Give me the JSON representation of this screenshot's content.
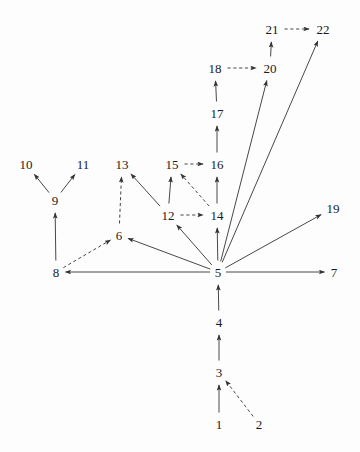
{
  "figure": {
    "type": "directed-graph",
    "background_color": "#fdfdfd",
    "stroke_color": "#333333",
    "label_color": "#1a1a1a",
    "width": 360,
    "height": 452
  },
  "nodes": [
    {
      "id": "1",
      "label": "1",
      "x": 219,
      "y": 424
    },
    {
      "id": "2",
      "label": "2",
      "x": 259,
      "y": 424
    },
    {
      "id": "3",
      "label": "3",
      "x": 219,
      "y": 372
    },
    {
      "id": "4",
      "label": "4",
      "x": 219,
      "y": 322
    },
    {
      "id": "5",
      "label": "5",
      "x": 218,
      "y": 272
    },
    {
      "id": "6",
      "label": "6",
      "x": 119,
      "y": 235
    },
    {
      "id": "7",
      "label": "7",
      "x": 334,
      "y": 272
    },
    {
      "id": "8",
      "label": "8",
      "x": 56,
      "y": 272
    },
    {
      "id": "9",
      "label": "9",
      "x": 55,
      "y": 200
    },
    {
      "id": "10",
      "label": "10",
      "x": 26,
      "y": 164
    },
    {
      "id": "11",
      "label": "11",
      "x": 83,
      "y": 164
    },
    {
      "id": "12",
      "label": "12",
      "x": 168,
      "y": 215
    },
    {
      "id": "13",
      "label": "13",
      "x": 122,
      "y": 164
    },
    {
      "id": "14",
      "label": "14",
      "x": 217,
      "y": 215
    },
    {
      "id": "15",
      "label": "15",
      "x": 172,
      "y": 164
    },
    {
      "id": "16",
      "label": "16",
      "x": 217,
      "y": 164
    },
    {
      "id": "17",
      "label": "17",
      "x": 217,
      "y": 113
    },
    {
      "id": "18",
      "label": "18",
      "x": 215,
      "y": 68
    },
    {
      "id": "19",
      "label": "19",
      "x": 333,
      "y": 208
    },
    {
      "id": "20",
      "label": "20",
      "x": 270,
      "y": 68
    },
    {
      "id": "21",
      "label": "21",
      "x": 272,
      "y": 29
    },
    {
      "id": "22",
      "label": "22",
      "x": 323,
      "y": 29
    }
  ],
  "edges": [
    {
      "from": "1",
      "to": "3",
      "style": "solid"
    },
    {
      "from": "2",
      "to": "3",
      "style": "dashed"
    },
    {
      "from": "3",
      "to": "4",
      "style": "solid"
    },
    {
      "from": "4",
      "to": "5",
      "style": "solid"
    },
    {
      "from": "5",
      "to": "6",
      "style": "solid"
    },
    {
      "from": "5",
      "to": "7",
      "style": "solid"
    },
    {
      "from": "5",
      "to": "8",
      "style": "solid"
    },
    {
      "from": "5",
      "to": "12",
      "style": "solid"
    },
    {
      "from": "5",
      "to": "14",
      "style": "solid"
    },
    {
      "from": "5",
      "to": "19",
      "style": "solid"
    },
    {
      "from": "5",
      "to": "20",
      "style": "solid"
    },
    {
      "from": "5",
      "to": "22",
      "style": "solid"
    },
    {
      "from": "6",
      "to": "13",
      "style": "dashed"
    },
    {
      "from": "8",
      "to": "6",
      "style": "dashed"
    },
    {
      "from": "8",
      "to": "9",
      "style": "solid"
    },
    {
      "from": "9",
      "to": "10",
      "style": "solid"
    },
    {
      "from": "9",
      "to": "11",
      "style": "solid"
    },
    {
      "from": "12",
      "to": "13",
      "style": "solid"
    },
    {
      "from": "12",
      "to": "14",
      "style": "dashed"
    },
    {
      "from": "12",
      "to": "15",
      "style": "solid"
    },
    {
      "from": "14",
      "to": "15",
      "style": "dashed"
    },
    {
      "from": "14",
      "to": "16",
      "style": "solid"
    },
    {
      "from": "15",
      "to": "16",
      "style": "dashed"
    },
    {
      "from": "16",
      "to": "17",
      "style": "solid"
    },
    {
      "from": "17",
      "to": "18",
      "style": "solid"
    },
    {
      "from": "18",
      "to": "20",
      "style": "dashed"
    },
    {
      "from": "20",
      "to": "21",
      "style": "solid"
    },
    {
      "from": "21",
      "to": "22",
      "style": "dashed"
    }
  ]
}
